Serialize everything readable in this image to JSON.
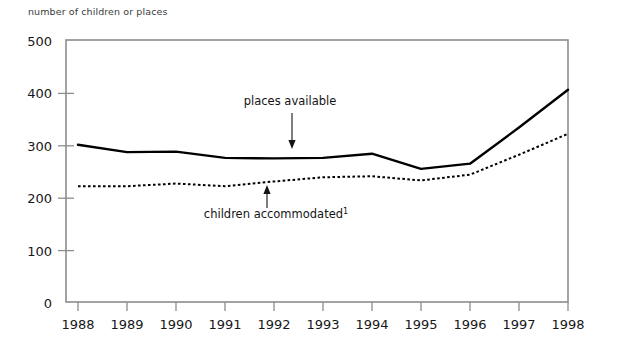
{
  "chart_data": {
    "type": "line",
    "title": "",
    "ylabel": "number of children or places",
    "xlabel": "",
    "ylim": [
      0,
      500
    ],
    "yticks": [
      0,
      100,
      200,
      300,
      400,
      500
    ],
    "grid": false,
    "legend": "annotated-inline",
    "categories": [
      "1988",
      "1989",
      "1990",
      "1991",
      "1992",
      "1993",
      "1994",
      "1995",
      "1996",
      "1997",
      "1998"
    ],
    "x": [
      1988,
      1989,
      1990,
      1991,
      1992,
      1993,
      1994,
      1995,
      1996,
      1997,
      1998
    ],
    "series": [
      {
        "name": "places available",
        "style": "solid",
        "values": [
          300,
          286,
          287,
          275,
          274,
          275,
          283,
          254,
          264,
          333,
          405
        ]
      },
      {
        "name": "children accommodated",
        "style": "dotted",
        "footnote_marker": "1",
        "values": [
          221,
          221,
          226,
          221,
          230,
          238,
          240,
          232,
          243,
          281,
          321
        ]
      }
    ],
    "annotations": [
      {
        "text": "places available",
        "footnote_marker": "",
        "target_year": 1992,
        "target_value": 274,
        "arrow": "down"
      },
      {
        "text": "children accommodated",
        "footnote_marker": "1",
        "target_year": 1992,
        "target_value": 230,
        "arrow": "up"
      }
    ],
    "colors": {
      "series_line": "#000000",
      "axis": "#8d8d8d",
      "text": "#171717",
      "background": "#ffffff"
    }
  }
}
